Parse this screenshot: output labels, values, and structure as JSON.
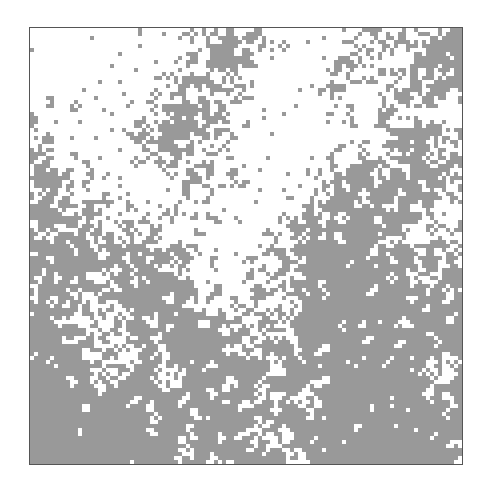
{
  "grid": {
    "cols": 108,
    "rows": 109,
    "cell_px": 4,
    "seed": 7331,
    "colors": {
      "on": "#999999",
      "off": "#ffffff",
      "border": "#555555"
    },
    "density_map": [
      [
        0.02,
        0.02,
        0.03,
        0.04,
        0.05,
        0.1,
        0.45,
        0.55,
        0.35,
        0.1,
        0.15,
        0.3,
        0.45,
        0.35,
        0.45,
        0.6
      ],
      [
        0.03,
        0.04,
        0.06,
        0.08,
        0.1,
        0.3,
        0.55,
        0.55,
        0.2,
        0.06,
        0.1,
        0.55,
        0.4,
        0.3,
        0.55,
        0.75
      ],
      [
        0.1,
        0.08,
        0.12,
        0.15,
        0.25,
        0.45,
        0.45,
        0.3,
        0.1,
        0.05,
        0.15,
        0.35,
        0.2,
        0.4,
        0.35,
        0.4
      ],
      [
        0.3,
        0.15,
        0.12,
        0.12,
        0.6,
        0.85,
        0.55,
        0.3,
        0.1,
        0.05,
        0.08,
        0.1,
        0.2,
        0.3,
        0.45,
        0.3
      ],
      [
        0.35,
        0.25,
        0.15,
        0.15,
        0.55,
        0.8,
        0.5,
        0.2,
        0.08,
        0.05,
        0.1,
        0.25,
        0.4,
        0.55,
        0.65,
        0.45
      ],
      [
        0.6,
        0.5,
        0.25,
        0.15,
        0.2,
        0.25,
        0.3,
        0.25,
        0.1,
        0.05,
        0.2,
        0.5,
        0.6,
        0.7,
        0.75,
        0.6
      ],
      [
        0.65,
        0.45,
        0.4,
        0.2,
        0.25,
        0.3,
        0.35,
        0.1,
        0.06,
        0.08,
        0.35,
        0.55,
        0.65,
        0.6,
        0.55,
        0.4
      ],
      [
        0.55,
        0.6,
        0.45,
        0.5,
        0.45,
        0.4,
        0.2,
        0.08,
        0.2,
        0.35,
        0.55,
        0.65,
        0.7,
        0.55,
        0.45,
        0.35
      ],
      [
        0.6,
        0.75,
        0.7,
        0.7,
        0.6,
        0.45,
        0.2,
        0.15,
        0.25,
        0.45,
        0.7,
        0.8,
        0.75,
        0.65,
        0.55,
        0.5
      ],
      [
        0.7,
        0.6,
        0.45,
        0.5,
        0.55,
        0.6,
        0.35,
        0.2,
        0.35,
        0.45,
        0.75,
        0.85,
        0.8,
        0.7,
        0.65,
        0.6
      ],
      [
        0.75,
        0.55,
        0.4,
        0.45,
        0.65,
        0.75,
        0.6,
        0.35,
        0.4,
        0.55,
        0.8,
        0.8,
        0.7,
        0.75,
        0.7,
        0.65
      ],
      [
        0.8,
        0.55,
        0.35,
        0.4,
        0.55,
        0.75,
        0.8,
        0.55,
        0.45,
        0.65,
        0.75,
        0.7,
        0.75,
        0.8,
        0.8,
        0.75
      ],
      [
        0.85,
        0.75,
        0.4,
        0.45,
        0.7,
        0.5,
        0.75,
        0.75,
        0.5,
        0.55,
        0.6,
        0.75,
        0.8,
        0.75,
        0.65,
        0.45
      ],
      [
        0.9,
        0.85,
        0.65,
        0.55,
        0.75,
        0.55,
        0.6,
        0.55,
        0.6,
        0.45,
        0.55,
        0.8,
        0.85,
        0.75,
        0.65,
        0.5
      ],
      [
        0.92,
        0.92,
        0.88,
        0.85,
        0.85,
        0.75,
        0.6,
        0.8,
        0.65,
        0.5,
        0.75,
        0.85,
        0.88,
        0.8,
        0.75,
        0.8
      ],
      [
        0.92,
        0.9,
        0.88,
        0.85,
        0.85,
        0.7,
        0.5,
        0.7,
        0.55,
        0.35,
        0.7,
        0.85,
        0.9,
        0.85,
        0.8,
        0.8
      ]
    ]
  }
}
